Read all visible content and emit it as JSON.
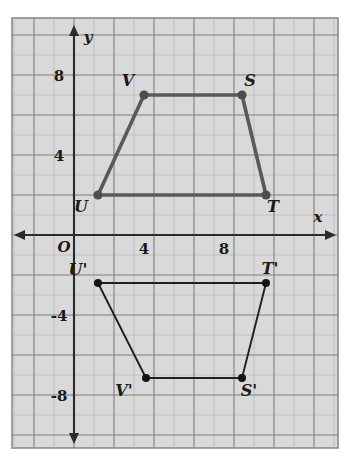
{
  "figure": {
    "axes": {
      "x_axis_label": "x",
      "y_axis_label": "y",
      "origin_label": "O",
      "x_ticks": [
        {
          "value": 4,
          "label": "4"
        },
        {
          "value": 8,
          "label": "8"
        }
      ],
      "y_ticks": [
        {
          "value": 8,
          "label": "8"
        },
        {
          "value": 4,
          "label": "4"
        },
        {
          "value": -4,
          "label": "-4"
        },
        {
          "value": -8,
          "label": "-8"
        }
      ],
      "x_range": [
        -3,
        13
      ],
      "y_range": [
        -10,
        10
      ],
      "grid": true,
      "unit_px": 20
    },
    "colors": {
      "grid_fill": "#d9d9d9",
      "grid_minor": "#b6b6b6",
      "grid_major": "#7e7e7e",
      "axis": "#2b2b2b",
      "preimage_stroke": "#595959",
      "image_stroke": "#1f1f1f"
    },
    "shapes": [
      {
        "name": "preimage-trapezoid",
        "id": "STUV",
        "vertices": [
          {
            "label": "V",
            "x": 3.5,
            "y": 7,
            "label_dx": -16,
            "label_dy": -9
          },
          {
            "label": "S",
            "x": 8.4,
            "y": 7,
            "label_dx": 8,
            "label_dy": -9
          },
          {
            "label": "T",
            "x": 9.6,
            "y": 2,
            "label_dx": 7,
            "label_dy": 17
          },
          {
            "label": "U",
            "x": 1.2,
            "y": 2,
            "label_dx": -17,
            "label_dy": 17
          }
        ]
      },
      {
        "name": "image-trapezoid",
        "id": "S'T'U'V'",
        "vertices": [
          {
            "label": "U'",
            "x": 1.2,
            "y": -2.4,
            "label_dx": -20,
            "label_dy": -8
          },
          {
            "label": "T'",
            "x": 9.6,
            "y": -2.4,
            "label_dx": 4,
            "label_dy": -9
          },
          {
            "label": "S'",
            "x": 8.4,
            "y": -7.15,
            "label_dx": 7,
            "label_dy": 18
          },
          {
            "label": "V'",
            "x": 3.6,
            "y": -7.15,
            "label_dx": -22,
            "label_dy": 18
          }
        ]
      }
    ]
  }
}
